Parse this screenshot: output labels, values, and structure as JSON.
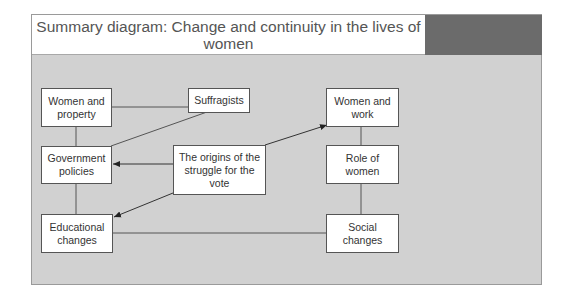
{
  "header": {
    "title": "Summary diagram: Change and continuity in the lives of women",
    "accent_color": "#6b6b6b"
  },
  "diagram": {
    "background_color": "#d1d1d1",
    "nodes": [
      {
        "id": "women-property",
        "label": "Women and property"
      },
      {
        "id": "suffragists",
        "label": "Suffragists"
      },
      {
        "id": "government-policies",
        "label": "Government policies"
      },
      {
        "id": "origins",
        "label": "The origins of the struggle for the vote"
      },
      {
        "id": "educational-changes",
        "label": "Educational changes"
      },
      {
        "id": "women-work",
        "label": "Women and work"
      },
      {
        "id": "role-of-women",
        "label": "Role of women"
      },
      {
        "id": "social-changes",
        "label": "Social changes"
      }
    ],
    "edges": [
      {
        "from": "women-property",
        "to": "suffragists",
        "arrow": false
      },
      {
        "from": "women-property",
        "to": "government-policies",
        "arrow": false
      },
      {
        "from": "suffragists",
        "to": "government-policies",
        "arrow": false
      },
      {
        "from": "government-policies",
        "to": "educational-changes",
        "arrow": false
      },
      {
        "from": "origins",
        "to": "government-policies",
        "arrow": true
      },
      {
        "from": "origins",
        "to": "educational-changes",
        "arrow": true
      },
      {
        "from": "origins",
        "to": "women-work",
        "arrow": true
      },
      {
        "from": "women-work",
        "to": "role-of-women",
        "arrow": false
      },
      {
        "from": "role-of-women",
        "to": "social-changes",
        "arrow": false
      },
      {
        "from": "educational-changes",
        "to": "social-changes",
        "arrow": false
      }
    ]
  }
}
